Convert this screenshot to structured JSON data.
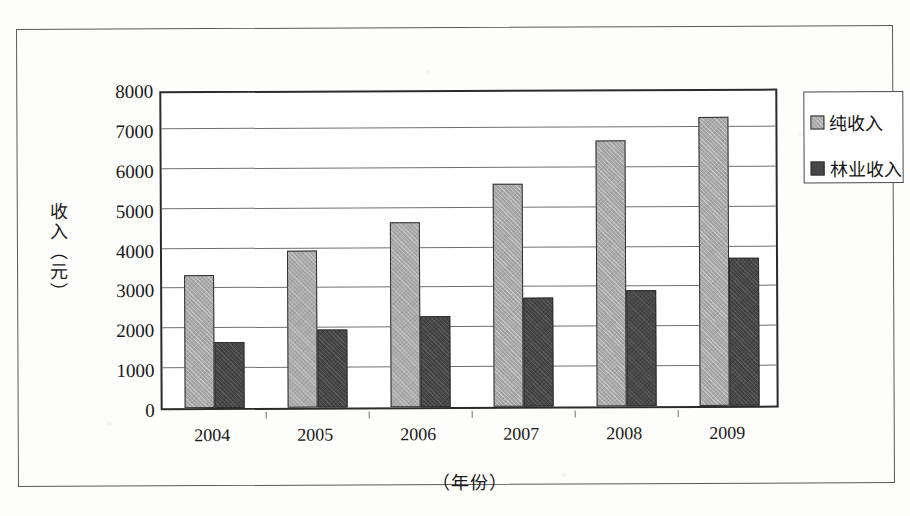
{
  "chart_data": {
    "type": "bar",
    "title": "",
    "subtitle": "",
    "xlabel": "（年份）",
    "ylabel": "收入（元）",
    "categories": [
      "2004",
      "2005",
      "2006",
      "2007",
      "2008",
      "2009"
    ],
    "series": [
      {
        "name": "纯收入",
        "color": "#a9a9a9",
        "values": [
          3330,
          3940,
          4640,
          5590,
          6670,
          7240
        ]
      },
      {
        "name": "林业收入",
        "color": "#474747",
        "values": [
          1650,
          1950,
          2280,
          2730,
          2910,
          3710
        ]
      }
    ],
    "ylim": [
      0,
      8000
    ],
    "ytick_step": 1000,
    "yticks": [
      0,
      1000,
      2000,
      3000,
      4000,
      5000,
      6000,
      7000,
      8000
    ],
    "ytick_labels": [
      "0",
      "1000",
      "2000",
      "3000",
      "4000",
      "5000",
      "6000",
      "7000",
      "8000"
    ],
    "grid": true,
    "grid_axis": "y",
    "legend_position": "right-outside",
    "legend_entries": [
      "纯收入",
      "林业收入"
    ],
    "bar_style": "grouped",
    "plot_background": "#ffffff",
    "axis_color": "#2b2b2b",
    "gridline_color": "#6f6f6f"
  }
}
